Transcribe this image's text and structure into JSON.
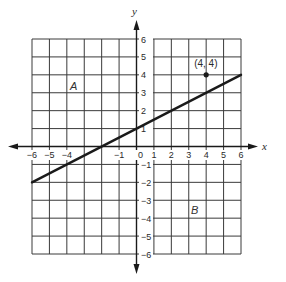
{
  "axes": {
    "x_label": "x",
    "y_label": "y",
    "x_ticks": [
      "−6",
      "−5",
      "−4",
      "−1",
      "0",
      "1",
      "2",
      "3",
      "4",
      "5",
      "6"
    ],
    "y_ticks_pos": [
      "6",
      "5",
      "4",
      "3",
      "2",
      "1"
    ],
    "y_ticks_neg": [
      "−1",
      "−2",
      "−3",
      "−4",
      "−5",
      "−6"
    ],
    "range": {
      "xmin": -6,
      "xmax": 6,
      "ymin": -6,
      "ymax": 6
    }
  },
  "line": {
    "from": [
      -6,
      -2
    ],
    "to": [
      6,
      4
    ],
    "equation": "y = 0.5x + 1",
    "color": "#1a1a1a"
  },
  "point": {
    "label": "(4, 4)",
    "x": 4,
    "y": 4
  },
  "regions": {
    "a_label": "A",
    "b_label": "B"
  },
  "colors": {
    "grid": "#3a3a3a",
    "axis": "#1a1a1a",
    "background": "#ffffff"
  }
}
